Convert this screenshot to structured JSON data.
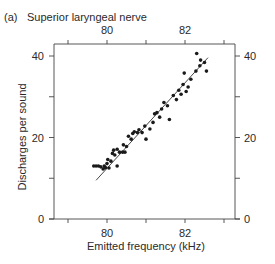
{
  "panel": {
    "letter": "(a)",
    "title": "Superior laryngeal nerve"
  },
  "chart_data": {
    "type": "scatter",
    "title": "Superior laryngeal nerve",
    "panel_label": "(a)",
    "xlabel": "Emitted frequency (kHz)",
    "ylabel": "Discharges per sound",
    "xlim": [
      79.0,
      83.3
    ],
    "ylim": [
      0,
      43
    ],
    "x_ticks_labeled": [
      80,
      82
    ],
    "x_ticks_minor": [
      79,
      81,
      83
    ],
    "y_ticks_labeled": [
      0,
      20,
      40
    ],
    "y_ticks_minor": [
      10,
      30
    ],
    "top_axis_ticks_labeled": [
      80,
      82
    ],
    "right_axis_ticks_labeled": [
      0,
      20,
      40
    ],
    "grid": false,
    "legend": null,
    "series": [
      {
        "name": "discharges",
        "points": [
          [
            79.66,
            13.0
          ],
          [
            79.72,
            13.0
          ],
          [
            79.78,
            13.0
          ],
          [
            79.84,
            12.8
          ],
          [
            79.9,
            12.3
          ],
          [
            79.93,
            13.0
          ],
          [
            79.96,
            12.6
          ],
          [
            80.0,
            13.6
          ],
          [
            80.05,
            12.5
          ],
          [
            80.02,
            14.6
          ],
          [
            80.1,
            14.2
          ],
          [
            80.26,
            13.0
          ],
          [
            80.14,
            16.1
          ],
          [
            80.2,
            15.7
          ],
          [
            80.17,
            16.9
          ],
          [
            80.26,
            17.1
          ],
          [
            80.32,
            16.4
          ],
          [
            80.4,
            16.4
          ],
          [
            80.46,
            16.4
          ],
          [
            80.42,
            18.2
          ],
          [
            80.5,
            17.8
          ],
          [
            80.55,
            20.3
          ],
          [
            80.62,
            19.6
          ],
          [
            80.66,
            21.0
          ],
          [
            80.7,
            21.4
          ],
          [
            80.78,
            21.2
          ],
          [
            80.82,
            21.9
          ],
          [
            80.9,
            21.2
          ],
          [
            80.97,
            22.8
          ],
          [
            81.0,
            19.6
          ],
          [
            81.1,
            22.1
          ],
          [
            81.18,
            23.7
          ],
          [
            81.22,
            25.8
          ],
          [
            81.28,
            26.1
          ],
          [
            81.35,
            25.0
          ],
          [
            81.4,
            27.0
          ],
          [
            81.46,
            28.6
          ],
          [
            81.55,
            27.8
          ],
          [
            81.6,
            24.4
          ],
          [
            81.7,
            30.3
          ],
          [
            81.78,
            29.3
          ],
          [
            81.84,
            31.6
          ],
          [
            81.9,
            30.6
          ],
          [
            81.95,
            33.0
          ],
          [
            82.03,
            31.3
          ],
          [
            82.08,
            32.4
          ],
          [
            81.98,
            35.8
          ],
          [
            82.15,
            34.3
          ],
          [
            82.28,
            36.3
          ],
          [
            82.38,
            37.6
          ],
          [
            82.3,
            40.6
          ],
          [
            82.4,
            39.0
          ],
          [
            82.5,
            38.4
          ],
          [
            82.55,
            36.3
          ]
        ]
      }
    ],
    "regression_line": {
      "x": [
        79.72,
        82.59
      ],
      "y": [
        9.5,
        39.6
      ]
    }
  }
}
